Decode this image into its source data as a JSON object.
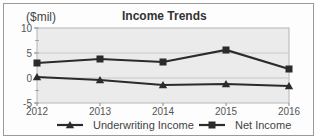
{
  "chart_data": {
    "type": "line",
    "title": "Income Trends",
    "ylabel": "($mil)",
    "xlabel": "",
    "x": [
      "2012",
      "2013",
      "2014",
      "2015",
      "2016"
    ],
    "ylim": [
      -5,
      10
    ],
    "yticks": [
      "10",
      "5",
      "0",
      "-5"
    ],
    "grid": true,
    "legend_position": "bottom",
    "series": [
      {
        "name": "Underwriting Income",
        "marker": "triangle",
        "values": [
          0.2,
          -0.4,
          -1.4,
          -1.2,
          -1.6
        ]
      },
      {
        "name": "Net Income",
        "marker": "square",
        "values": [
          3.0,
          3.8,
          3.2,
          5.6,
          1.8
        ]
      }
    ]
  },
  "colors": {
    "plot_bg": "#ebebeb",
    "line": "#2b2b2b",
    "grid": "#c8c8c8"
  }
}
